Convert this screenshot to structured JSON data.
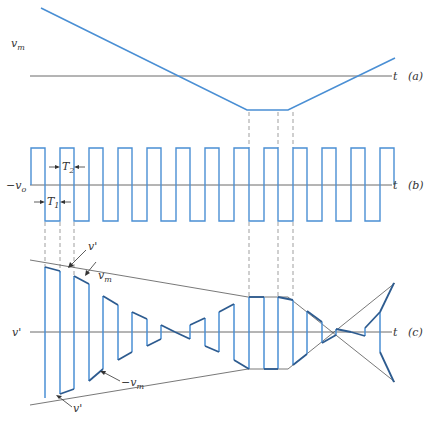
{
  "figure": {
    "panels": [
      {
        "id": "a",
        "tag": "(a)",
        "y_label": "v",
        "y_label_sub": "m",
        "axis_label": "t",
        "description": "Modulating signal v_m: linear decrease, flat minimum, linear increase"
      },
      {
        "id": "b",
        "tag": "(b)",
        "y_label": "−v",
        "y_label_sub": "o",
        "axis_label": "t",
        "t2_label": "T",
        "t2_sub": "2",
        "t1_label": "T",
        "t1_sub": "1",
        "description": "Square wave with levels +v_o and -v_o; periods T1 and T2"
      },
      {
        "id": "c",
        "tag": "(c)",
        "y_label": "v'",
        "axis_label": "t",
        "annotations": [
          {
            "text": "v'",
            "sub": ""
          },
          {
            "text": "v",
            "sub": "m"
          },
          {
            "text": "−v",
            "sub": "m"
          },
          {
            "text": "v'",
            "sub": ""
          }
        ],
        "description": "Chopped output v' bounded by envelopes v_m and -v_m"
      }
    ],
    "colors": {
      "signal": "#4a8fd4",
      "envelope": "#2d5b8f",
      "axis": "#444444"
    }
  }
}
